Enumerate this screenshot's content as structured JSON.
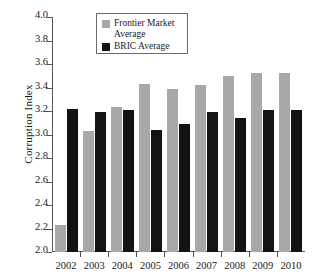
{
  "chart_data": {
    "type": "bar",
    "title": "",
    "xlabel": "",
    "ylabel": "Corruption Index",
    "categories": [
      "2002",
      "2003",
      "2004",
      "2005",
      "2006",
      "2007",
      "2008",
      "2009",
      "2010"
    ],
    "series": [
      {
        "name": "Frontier Market Average",
        "color": "#a8a8a8",
        "values": [
          2.23,
          3.03,
          3.23,
          3.43,
          3.39,
          3.42,
          3.5,
          3.52,
          3.52
        ]
      },
      {
        "name": "BRIC Average",
        "color": "#131313",
        "values": [
          3.22,
          3.19,
          3.21,
          3.04,
          3.09,
          3.19,
          3.14,
          3.21,
          3.21
        ]
      }
    ],
    "ylim": [
      2.0,
      4.0
    ],
    "yticks": [
      "2.0",
      "2.2",
      "2.4",
      "2.6",
      "2.8",
      "3.0",
      "3.2",
      "3.4",
      "3.6",
      "3.8",
      "4.0"
    ],
    "ytick_values": [
      2.0,
      2.2,
      2.4,
      2.6,
      2.8,
      3.0,
      3.2,
      3.4,
      3.6,
      3.8,
      4.0
    ],
    "grid": false,
    "legend_position": "top-center"
  },
  "legend": {
    "items": [
      {
        "label": "Frontier Market Average",
        "swatch": "frontier"
      },
      {
        "label": "BRIC Average",
        "swatch": "bric"
      }
    ]
  }
}
